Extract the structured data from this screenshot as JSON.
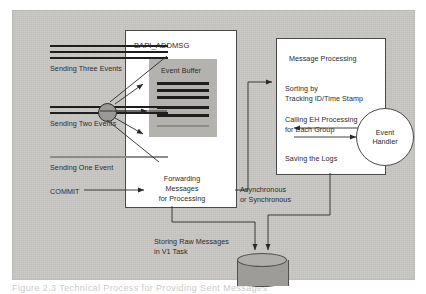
{
  "figure": {
    "caption": "Figure 2.3   Technical Process for Providing Sent Messages",
    "background_color": "#c9c7c3",
    "box_fill": "#ffffff",
    "buffer_fill": "#b4b2ae",
    "line_color": "#2a2a2a"
  },
  "inputs": {
    "three_events_label": "Sending Three Events",
    "two_events_label": "Sending Two Events",
    "one_event_label": "Sending One Event",
    "commit_label": "COMMIT",
    "three_events_bars": 3,
    "two_events_bars": 2,
    "one_event_bars": 1
  },
  "bapi": {
    "title": "BAPI_ADDMSG",
    "buffer_title": "Event Buffer",
    "buffer_bars": [
      {
        "tone": "dark"
      },
      {
        "tone": "dark"
      },
      {
        "tone": "dark"
      },
      {
        "tone": "dark"
      },
      {
        "tone": "dark"
      },
      {
        "tone": "light"
      }
    ],
    "forwarding_line1": "Forwarding",
    "forwarding_line2": "Messages",
    "forwarding_line3": "for Processing"
  },
  "processing": {
    "title": "Message Processing",
    "step1_line1": "Sorting by",
    "step1_line2": "Tracking ID/Time Stamp",
    "step2_line1": "Calling EH Processing",
    "step2_line2": "for Each Group",
    "step3": "Saving the Logs"
  },
  "event_handler": {
    "line1": "Event",
    "line2": "Handler"
  },
  "annotations": {
    "async_line1": "Asynchronous",
    "async_line2": "or Synchronous",
    "storing_line1": "Storing Raw Messages",
    "storing_line2": "in V1 Task"
  }
}
